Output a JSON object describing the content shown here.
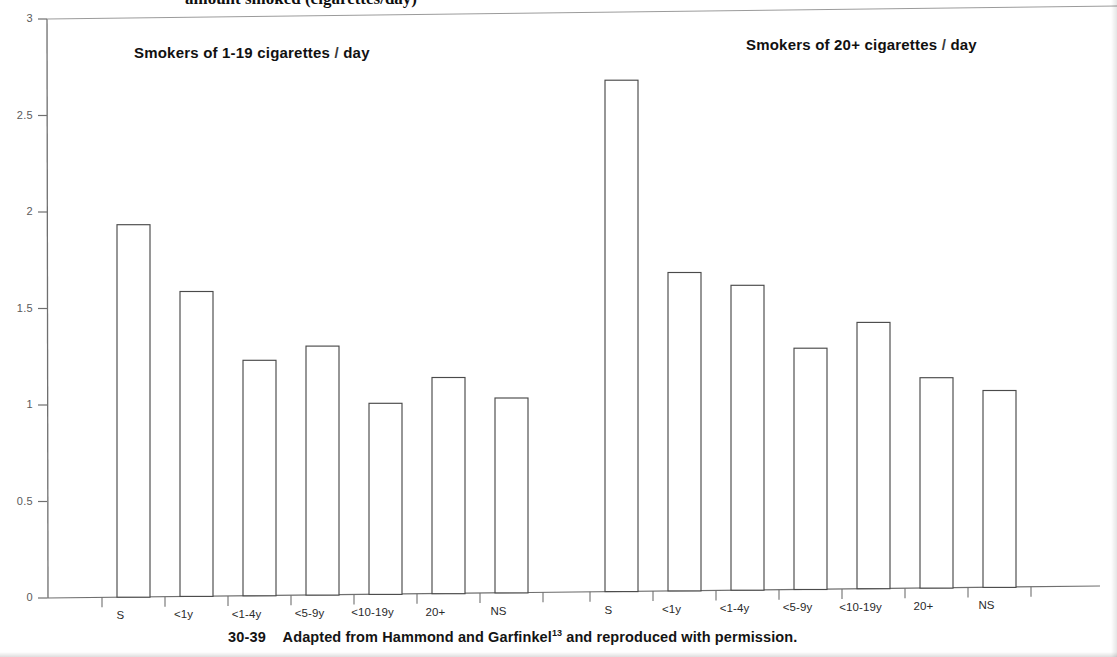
{
  "figure": {
    "title_partial": "amount smoked (cigarettes/day)",
    "caption_panel_id": "30-39",
    "caption_text": "Adapted from Hammond and Garfinkel",
    "caption_ref": "13",
    "caption_tail": " and reproduced with permission."
  },
  "annotations": [
    {
      "text_before": "Smokers of 1-19 cigarettes ",
      "slash": "/",
      "text_after": " day"
    },
    {
      "text_before": "Smokers of 20+ cigarettes ",
      "slash": "/",
      "text_after": " day"
    }
  ],
  "chart_data": {
    "type": "bar",
    "title": "amount smoked (cigarettes/day)",
    "xlabel": "",
    "ylabel": "",
    "ylim": [
      0,
      3
    ],
    "yticks": [
      "0",
      "0.5",
      "1",
      "1.5",
      "2",
      "2.5",
      "3"
    ],
    "ytick_values": [
      0,
      0.5,
      1,
      1.5,
      2,
      2.5,
      3
    ],
    "grid": false,
    "legend_position": "none",
    "bar_style": {
      "fill": "#ffffff",
      "stroke": "#4a4a4a"
    },
    "axis_color": "#6f6f6f",
    "groups": [
      {
        "name": "Smokers of 1-19 cigarettes / day",
        "categories": [
          "S",
          "<1y",
          "<1-4y",
          "<5-9y",
          "<10-19y",
          "20+",
          "NS"
        ],
        "values": [
          1.93,
          1.58,
          1.22,
          1.29,
          0.99,
          1.12,
          1.01
        ]
      },
      {
        "name": "Smokers of 20+ cigarettes / day",
        "categories": [
          "S",
          "<1y",
          "<1-4y",
          "<5-9y",
          "<10-19y",
          "20+",
          "NS"
        ],
        "values": [
          2.65,
          1.65,
          1.58,
          1.25,
          1.38,
          1.09,
          1.02
        ]
      }
    ]
  }
}
